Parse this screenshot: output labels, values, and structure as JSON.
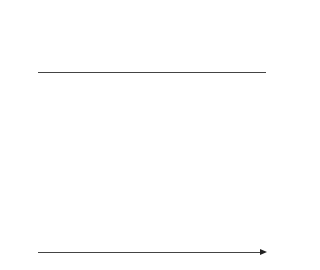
{
  "arrivals": [
    {
      "label": "Cell",
      "type": "cell",
      "x": 64
    },
    {
      "label": "Cell",
      "type": "cell",
      "x": 109
    },
    {
      "label": "Cell",
      "type": "cell",
      "x": 154
    },
    {
      "label": "No cell",
      "type": "no-cell",
      "x": 200
    },
    {
      "label": "No cell",
      "type": "no-cell",
      "x": 245
    }
  ],
  "y_axis": {
    "ticks": [
      "0",
      "1",
      "2",
      "3",
      "4",
      "5",
      "6",
      "7",
      "8",
      "9",
      "10",
      "11"
    ],
    "min": 0,
    "max": 11
  },
  "x_axis": {
    "label": "Time"
  },
  "columns": [
    {
      "label": "t–",
      "fill": 0,
      "x": 44
    },
    {
      "label": "t+",
      "fill": 4.5,
      "x": 64
    },
    {
      "label": "t–",
      "fill": 3.5,
      "x": 89
    },
    {
      "label": "t+",
      "fill": 8,
      "x": 109
    },
    {
      "label": "t–",
      "fill": 7,
      "x": 134
    },
    {
      "label": "t+",
      "fill": 11,
      "x": 154
    },
    {
      "label": "t–",
      "fill": 10,
      "x": 180
    },
    {
      "label": "t+",
      "fill": 10,
      "x": 200
    },
    {
      "label": "t–",
      "fill": 9,
      "x": 226
    },
    {
      "label": "t+",
      "fill": 9,
      "x": 245
    }
  ],
  "colors": {
    "fill": "#a9a9a9",
    "line": "#444444"
  }
}
